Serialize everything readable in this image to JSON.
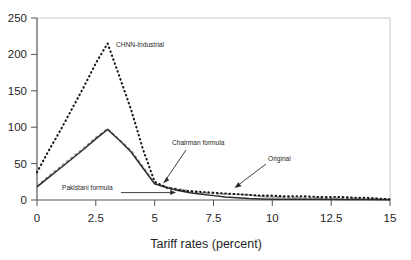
{
  "chart_data": {
    "type": "line",
    "title": "",
    "xlabel": "Tariff rates (percent)",
    "ylabel": "",
    "xlim": [
      0,
      15
    ],
    "ylim": [
      0,
      250
    ],
    "grid": false,
    "legend_position": "none (inline annotations with arrows)",
    "xticks": [
      "0",
      "2.5",
      "5",
      "7.5",
      "10",
      "12.5",
      "15"
    ],
    "xtick_values": [
      0,
      2.5,
      5,
      7.5,
      10,
      12.5,
      15
    ],
    "yticks": [
      "0",
      "50",
      "100",
      "150",
      "200",
      "250"
    ],
    "ytick_values": [
      0,
      50,
      100,
      150,
      200,
      250
    ],
    "series": [
      {
        "name": "CHNN-Industrial",
        "style": "dotted",
        "color": "#1a1a1a",
        "x": [
          0,
          0.5,
          1,
          1.5,
          2,
          2.5,
          3,
          3.5,
          4,
          4.5,
          5,
          5.5,
          6,
          6.5,
          7,
          7.5,
          8,
          8.5,
          9,
          9.5,
          10,
          10.5,
          11,
          11.5,
          12,
          12.5,
          13,
          13.5,
          14,
          14.5,
          15
        ],
        "values": [
          38,
          68,
          96,
          126,
          156,
          188,
          215,
          170,
          124,
          70,
          25,
          17,
          14,
          12,
          11,
          10,
          9,
          8,
          7,
          6,
          6,
          5,
          5,
          5,
          4,
          4,
          4,
          3,
          3,
          2,
          1
        ]
      },
      {
        "name": "Pakistani formula",
        "style": "solid",
        "color": "#2b2b2b",
        "x": [
          0,
          0.5,
          1,
          1.5,
          2,
          2.5,
          3,
          3.5,
          4,
          4.5,
          5,
          5.5,
          6,
          6.5,
          7,
          7.5,
          8,
          8.5,
          9,
          9.5,
          10,
          11,
          12,
          13,
          14,
          15
        ],
        "values": [
          18,
          31,
          44,
          57,
          70,
          84,
          97,
          82,
          66,
          44,
          22,
          17,
          13,
          10,
          8,
          6,
          4,
          3,
          2,
          1.5,
          1.2,
          1,
          1,
          0.8,
          0.6,
          0.5
        ]
      },
      {
        "name": "Chairman formula",
        "style": "dashed",
        "color": "#9a9a9a",
        "x": [
          0,
          0.5,
          1,
          1.5,
          2,
          2.5,
          3,
          3.5,
          4,
          4.5,
          5,
          5.5,
          6,
          6.5,
          7,
          7.5,
          8,
          8.5,
          9,
          9.5,
          10,
          10.5,
          11,
          11.5,
          12,
          12.5,
          13,
          13.5,
          14,
          14.5,
          15
        ],
        "values": [
          19,
          33,
          46,
          59,
          72,
          86,
          98,
          83,
          68,
          46,
          23,
          18,
          15,
          12,
          10,
          9,
          8,
          8,
          7,
          5,
          4,
          4,
          3,
          3,
          3,
          2,
          2,
          2,
          1.5,
          1,
          0.8
        ]
      },
      {
        "name": "Original",
        "style": "dashed-gray-tail",
        "color": "#b4b4b4",
        "x": [
          5,
          5.5,
          6,
          6.5,
          7,
          7.5,
          8,
          8.5,
          9,
          9.5,
          10,
          11,
          12,
          13,
          14,
          15
        ],
        "values": [
          23,
          18,
          15,
          12,
          10,
          9,
          8,
          8,
          7,
          5,
          4,
          3,
          3,
          2,
          1.5,
          0.8
        ]
      }
    ],
    "annotations": [
      {
        "name": "chnn-industrial",
        "text": "CHNN-Industrial",
        "label_x": 116,
        "label_y": 47,
        "has_arrow": false
      },
      {
        "name": "chairman-formula",
        "text": "Chairman formula",
        "label_x": 172,
        "label_y": 145,
        "has_arrow": true,
        "arrow_from_x": 186,
        "arrow_from_y": 150,
        "arrow_to_x": 163,
        "arrow_to_y": 183
      },
      {
        "name": "original",
        "text": "Original",
        "label_x": 268,
        "label_y": 161,
        "has_arrow": true,
        "arrow_from_x": 267,
        "arrow_from_y": 165,
        "arrow_to_x": 235,
        "arrow_to_y": 188
      },
      {
        "name": "pakistani-formula",
        "text": "Pakistani formula",
        "label_x": 62,
        "label_y": 190,
        "has_arrow": true,
        "arrow_from_x": 122,
        "arrow_from_y": 193,
        "arrow_to_x": 176,
        "arrow_to_y": 193
      }
    ]
  },
  "colors": {
    "axis": "#555555",
    "plot_border": "#cccccc",
    "background": "#ffffff",
    "text": "#1a1a1a",
    "series_dark": "#1a1a1a",
    "series_gray": "#9a9a9a"
  }
}
